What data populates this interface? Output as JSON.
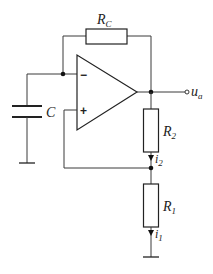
{
  "diagram": {
    "type": "circuit-schematic",
    "components": {
      "feedback_resistor": {
        "symbol": "R",
        "subscript": "C"
      },
      "capacitor": {
        "symbol": "C"
      },
      "resistor_2": {
        "symbol": "R",
        "subscript": "2"
      },
      "resistor_1": {
        "symbol": "R",
        "subscript": "1"
      },
      "opamp": {
        "inverting_sign": "−",
        "noninverting_sign": "+"
      }
    },
    "currents": {
      "i2": {
        "symbol": "i",
        "subscript": "2"
      },
      "i1": {
        "symbol": "i",
        "subscript": "1"
      }
    },
    "output": {
      "symbol": "u",
      "subscript": "a"
    },
    "colors": {
      "line": "#3a3a3a",
      "background": "#ffffff"
    }
  }
}
